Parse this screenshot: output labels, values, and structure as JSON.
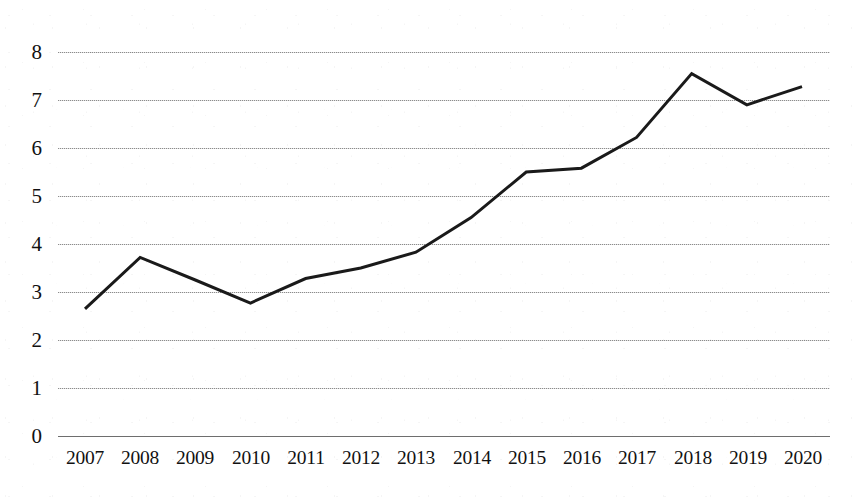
{
  "chart_data": {
    "type": "line",
    "title": "",
    "subtitle": "",
    "xlabel": "",
    "ylabel": "",
    "categories": [
      "2007",
      "2008",
      "2009",
      "2010",
      "2011",
      "2012",
      "2013",
      "2014",
      "2015",
      "2016",
      "2017",
      "2018",
      "2019",
      "2020"
    ],
    "values": [
      2.65,
      3.72,
      3.25,
      2.77,
      3.28,
      3.5,
      3.83,
      4.55,
      5.5,
      5.58,
      6.22,
      7.55,
      6.9,
      7.28
    ],
    "series": [
      {
        "name": "",
        "values": [
          2.65,
          3.72,
          3.25,
          2.77,
          3.28,
          3.5,
          3.83,
          4.55,
          5.5,
          5.58,
          6.22,
          7.55,
          6.9,
          7.28
        ]
      }
    ],
    "ylim": [
      0,
      8
    ],
    "ytick_labels": [
      "8",
      "7",
      "6",
      "5",
      "4",
      "3",
      "2",
      "1",
      "0"
    ],
    "ytick_values": [
      8,
      7,
      6,
      5,
      4,
      3,
      2,
      1,
      0
    ],
    "xtick_labels": [
      "2007",
      "2008",
      "2009",
      "2010",
      "2011",
      "2012",
      "2013",
      "2014",
      "2015",
      "2016",
      "2017",
      "2018",
      "2019",
      "2020"
    ],
    "grid": "horizontal",
    "legend": "none",
    "annotations": [],
    "colors": {
      "line": "#1a1a1a",
      "gridline": "#8c8c8c",
      "axis": "#6e6e6e",
      "text": "#111111",
      "background": "#ffffff"
    },
    "line_width": 3
  }
}
